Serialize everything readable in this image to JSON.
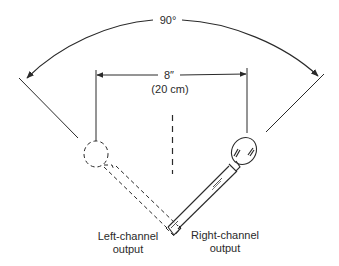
{
  "diagram": {
    "type": "stereo microphone placement (X-Y / near-coincident pair)",
    "angle_label": "90°",
    "spacing_label": "8″",
    "spacing_metric_label": "(20 cm)",
    "left_mic_label_line1": "Left-channel",
    "left_mic_label_line2": "output",
    "right_mic_label_line1": "Right-channel",
    "right_mic_label_line2": "output",
    "colors": {
      "ink": "#2a2a2a",
      "background": "#ffffff"
    },
    "elements": [
      {
        "name": "angle-arc",
        "style": "solid with arrowheads at both ends"
      },
      {
        "name": "left-axis-line",
        "style": "solid"
      },
      {
        "name": "right-axis-line",
        "style": "solid"
      },
      {
        "name": "spacing-dimension",
        "style": "solid with arrowheads"
      },
      {
        "name": "center-line",
        "style": "dashed"
      },
      {
        "name": "left-microphone",
        "style": "dashed outline (rotated position)"
      },
      {
        "name": "right-microphone",
        "style": "solid outline"
      }
    ]
  }
}
